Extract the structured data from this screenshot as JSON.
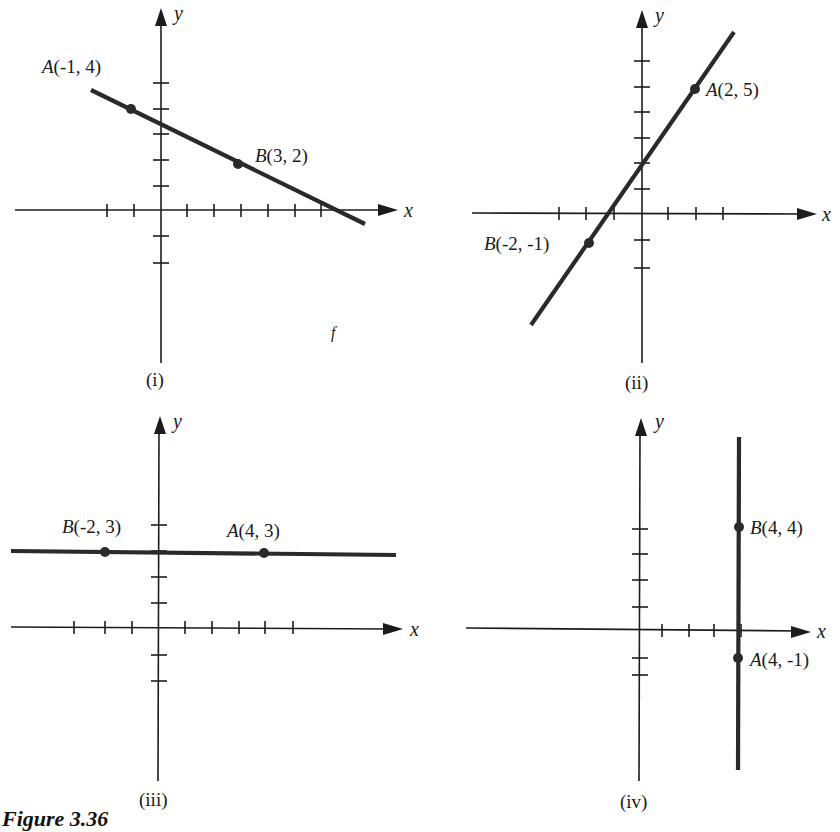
{
  "figure": {
    "caption": "Figure 3.36",
    "colors": {
      "ink": "#1c1c1c",
      "line": "#2a2a2a",
      "background": "#ffffff"
    }
  },
  "panels": [
    {
      "id": "i",
      "label": "(i)",
      "x_axis_name": "x",
      "y_axis_name": "y",
      "points": [
        {
          "name": "A",
          "coords": "(-1, 4)",
          "x": -1,
          "y": 4
        },
        {
          "name": "B",
          "coords": "(3, 2)",
          "x": 3,
          "y": 2
        }
      ],
      "line_type": "sloped"
    },
    {
      "id": "ii",
      "label": "(ii)",
      "x_axis_name": "x",
      "y_axis_name": "y",
      "points": [
        {
          "name": "A",
          "coords": "(2, 5)",
          "x": 2,
          "y": 5
        },
        {
          "name": "B",
          "coords": "(-2, -1)",
          "x": -2,
          "y": -1
        }
      ],
      "line_type": "sloped"
    },
    {
      "id": "iii",
      "label": "(iii)",
      "x_axis_name": "x",
      "y_axis_name": "y",
      "points": [
        {
          "name": "B",
          "coords": "(-2, 3)",
          "x": -2,
          "y": 3
        },
        {
          "name": "A",
          "coords": "(4, 3)",
          "x": 4,
          "y": 3
        }
      ],
      "line_type": "horizontal"
    },
    {
      "id": "iv",
      "label": "(iv)",
      "x_axis_name": "x",
      "y_axis_name": "y",
      "points": [
        {
          "name": "B",
          "coords": "(4, 4)",
          "x": 4,
          "y": 4
        },
        {
          "name": "A",
          "coords": "(4, -1)",
          "x": 4,
          "y": -1
        }
      ],
      "line_type": "vertical"
    }
  ]
}
